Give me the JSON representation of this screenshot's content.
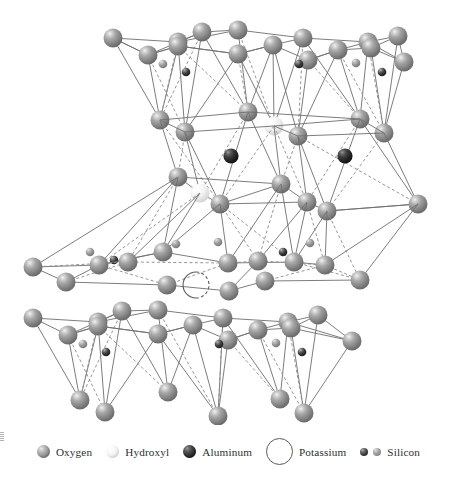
{
  "figure": {
    "background_color": "#ffffff"
  },
  "legend": {
    "items": [
      {
        "label": "Oxygen",
        "swatch": "sphere-large-gray",
        "color": "#8d8d8d",
        "size": 13
      },
      {
        "label": "Hydroxyl",
        "swatch": "sphere-large-white",
        "color": "#f2f2f2",
        "size": 13
      },
      {
        "label": "Aluminum",
        "swatch": "sphere-large-dark",
        "color": "#272727",
        "size": 13
      },
      {
        "label": "Potassium",
        "swatch": "circle-open-ring",
        "color": "#5a5a5a",
        "size": 27
      },
      {
        "label": "Silicon",
        "swatch": "sphere-small-pair",
        "color": "#3a3a3a",
        "size": 8
      }
    ]
  },
  "structure": {
    "atom_types": {
      "oxygen": {
        "name": "Oxygen",
        "radius": 9.5,
        "fill": "#8d8d8d",
        "highlight": "#efefef",
        "shadow": "#6e6e6e"
      },
      "hydroxyl": {
        "name": "Hydroxyl",
        "radius": 9.5,
        "fill": "#f2f2f2",
        "highlight": "#ffffff",
        "shadow": "#d2d2d2"
      },
      "aluminum": {
        "name": "Aluminum",
        "radius": 7.5,
        "fill": "#272727",
        "highlight": "#9a9a9a",
        "shadow": "#171717"
      },
      "silicon": {
        "name": "Silicon",
        "radius": 4.0,
        "fill": "#3a3a3a",
        "highlight": "#b0b0b0",
        "shadow": "#222222"
      },
      "potassium": {
        "name": "Potassium",
        "radius": 13.0,
        "fill": "none",
        "stroke": "#5a5a5a"
      }
    },
    "bond_style": {
      "solid_stroke": "#6e6e6e",
      "dashed_stroke": "#8a8a8a",
      "stroke_width": 0.9,
      "dash_array": "3,2.4"
    },
    "layers": [
      {
        "id": "top-tetrahedral-sheet",
        "label": "Upper tetrahedral (silica) sheet",
        "y_center": 70
      },
      {
        "id": "upper-octahedral-sheet",
        "label": "Octahedral (alumina) sheet",
        "y_center": 160
      },
      {
        "id": "mid-tetrahedral-sheet",
        "label": "Lower tetrahedral sheet of upper unit",
        "y_center": 215
      },
      {
        "id": "interlayer-potassium",
        "label": "Interlayer potassium plane",
        "y_center": 280
      },
      {
        "id": "bottom-tetrahedral-sheet",
        "label": "Lower unit tetrahedral sheet",
        "y_center": 345
      }
    ],
    "atoms": {
      "top_basal_back": [
        {
          "x": 113,
          "y": 38,
          "t": "oxygen"
        },
        {
          "x": 178,
          "y": 42,
          "t": "oxygen"
        },
        {
          "x": 202,
          "y": 32,
          "t": "oxygen"
        },
        {
          "x": 238,
          "y": 30,
          "t": "oxygen"
        },
        {
          "x": 303,
          "y": 38,
          "t": "oxygen"
        },
        {
          "x": 368,
          "y": 42,
          "t": "oxygen"
        },
        {
          "x": 398,
          "y": 36,
          "t": "oxygen"
        }
      ],
      "top_basal_front": [
        {
          "x": 148,
          "y": 55,
          "t": "oxygen"
        },
        {
          "x": 178,
          "y": 46,
          "t": "oxygen"
        },
        {
          "x": 238,
          "y": 54,
          "t": "oxygen"
        },
        {
          "x": 273,
          "y": 45,
          "t": "oxygen"
        },
        {
          "x": 308,
          "y": 60,
          "t": "oxygen"
        },
        {
          "x": 338,
          "y": 50,
          "t": "oxygen"
        },
        {
          "x": 371,
          "y": 48,
          "t": "oxygen"
        },
        {
          "x": 404,
          "y": 62,
          "t": "oxygen"
        }
      ],
      "top_silicon": [
        {
          "x": 163,
          "y": 64,
          "t": "silicon"
        },
        {
          "x": 186,
          "y": 72,
          "t": "silicon"
        },
        {
          "x": 299,
          "y": 64,
          "t": "silicon"
        },
        {
          "x": 356,
          "y": 63,
          "t": "silicon"
        },
        {
          "x": 382,
          "y": 72,
          "t": "silicon"
        }
      ],
      "top_apical": [
        {
          "x": 160,
          "y": 120,
          "t": "oxygen"
        },
        {
          "x": 185,
          "y": 132,
          "t": "oxygen"
        },
        {
          "x": 248,
          "y": 112,
          "t": "oxygen"
        },
        {
          "x": 274,
          "y": 126,
          "t": "hydroxyl"
        },
        {
          "x": 298,
          "y": 136,
          "t": "oxygen"
        },
        {
          "x": 360,
          "y": 119,
          "t": "oxygen"
        },
        {
          "x": 384,
          "y": 133,
          "t": "oxygen"
        }
      ],
      "upper_aluminum": [
        {
          "x": 231,
          "y": 156,
          "t": "aluminum"
        },
        {
          "x": 345,
          "y": 156,
          "t": "aluminum"
        }
      ],
      "mid_sheet": [
        {
          "x": 178,
          "y": 177,
          "t": "oxygen"
        },
        {
          "x": 200,
          "y": 193,
          "t": "hydroxyl"
        },
        {
          "x": 220,
          "y": 204,
          "t": "oxygen"
        },
        {
          "x": 281,
          "y": 184,
          "t": "oxygen"
        },
        {
          "x": 307,
          "y": 202,
          "t": "oxygen"
        },
        {
          "x": 327,
          "y": 211,
          "t": "oxygen"
        },
        {
          "x": 418,
          "y": 204,
          "t": "oxygen"
        }
      ],
      "inverted_tet_apices": [
        {
          "x": 90,
          "y": 252,
          "t": "silicon"
        },
        {
          "x": 176,
          "y": 244,
          "t": "silicon"
        },
        {
          "x": 283,
          "y": 252,
          "t": "silicon"
        },
        {
          "x": 310,
          "y": 243,
          "t": "silicon"
        }
      ],
      "interlayer_basal": [
        {
          "x": 33,
          "y": 267,
          "t": "oxygen"
        },
        {
          "x": 99,
          "y": 265,
          "t": "oxygen"
        },
        {
          "x": 128,
          "y": 262,
          "t": "oxygen"
        },
        {
          "x": 163,
          "y": 252,
          "t": "oxygen"
        },
        {
          "x": 228,
          "y": 263,
          "t": "oxygen"
        },
        {
          "x": 258,
          "y": 261,
          "t": "oxygen"
        },
        {
          "x": 294,
          "y": 262,
          "t": "oxygen"
        },
        {
          "x": 325,
          "y": 265,
          "t": "oxygen"
        },
        {
          "x": 66,
          "y": 282,
          "t": "oxygen"
        },
        {
          "x": 167,
          "y": 285,
          "t": "oxygen"
        },
        {
          "x": 229,
          "y": 291,
          "t": "oxygen"
        },
        {
          "x": 265,
          "y": 281,
          "t": "oxygen"
        },
        {
          "x": 360,
          "y": 280,
          "t": "oxygen"
        }
      ],
      "potassium": [
        {
          "x": 196,
          "y": 285,
          "t": "potassium"
        }
      ],
      "bottom_basal_back": [
        {
          "x": 33,
          "y": 318,
          "t": "oxygen"
        },
        {
          "x": 98,
          "y": 322,
          "t": "oxygen"
        },
        {
          "x": 122,
          "y": 311,
          "t": "oxygen"
        },
        {
          "x": 158,
          "y": 310,
          "t": "oxygen"
        },
        {
          "x": 223,
          "y": 318,
          "t": "oxygen"
        },
        {
          "x": 288,
          "y": 322,
          "t": "oxygen"
        },
        {
          "x": 318,
          "y": 315,
          "t": "oxygen"
        }
      ],
      "bottom_basal_front": [
        {
          "x": 68,
          "y": 335,
          "t": "oxygen"
        },
        {
          "x": 98,
          "y": 326,
          "t": "oxygen"
        },
        {
          "x": 158,
          "y": 334,
          "t": "oxygen"
        },
        {
          "x": 193,
          "y": 325,
          "t": "oxygen"
        },
        {
          "x": 228,
          "y": 340,
          "t": "oxygen"
        },
        {
          "x": 258,
          "y": 330,
          "t": "oxygen"
        },
        {
          "x": 291,
          "y": 328,
          "t": "oxygen"
        },
        {
          "x": 352,
          "y": 341,
          "t": "oxygen"
        }
      ],
      "bottom_silicon": [
        {
          "x": 83,
          "y": 344,
          "t": "silicon"
        },
        {
          "x": 106,
          "y": 352,
          "t": "silicon"
        },
        {
          "x": 219,
          "y": 344,
          "t": "silicon"
        },
        {
          "x": 276,
          "y": 343,
          "t": "silicon"
        },
        {
          "x": 302,
          "y": 352,
          "t": "silicon"
        }
      ],
      "bottom_apical": [
        {
          "x": 80,
          "y": 400,
          "t": "oxygen"
        },
        {
          "x": 105,
          "y": 412,
          "t": "oxygen"
        },
        {
          "x": 168,
          "y": 392,
          "t": "oxygen"
        },
        {
          "x": 218,
          "y": 416,
          "t": "oxygen"
        },
        {
          "x": 280,
          "y": 399,
          "t": "oxygen"
        },
        {
          "x": 304,
          "y": 413,
          "t": "oxygen"
        }
      ]
    }
  }
}
